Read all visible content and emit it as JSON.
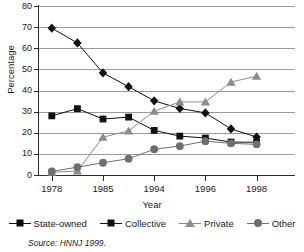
{
  "chart_data": {
    "type": "line",
    "title": "",
    "xlabel": "Year",
    "ylabel": "Percentage",
    "ylim": [
      0,
      80
    ],
    "ytick_step": 10,
    "yticks": [
      0,
      10,
      20,
      30,
      40,
      50,
      60,
      70,
      80
    ],
    "grid": true,
    "legend_position": "bottom",
    "x": [
      1,
      2,
      3,
      4,
      5,
      6,
      7,
      8,
      9,
      10
    ],
    "xtick_positions": [
      1,
      3,
      5,
      7,
      9
    ],
    "categories": [
      "1978",
      "",
      "1985",
      "",
      "1994",
      "",
      "1996",
      "",
      "1998",
      ""
    ],
    "xtick_labels": [
      "1978",
      "1985",
      "1994",
      "1996",
      "1998"
    ],
    "series": [
      {
        "name": "State-owned",
        "marker": "diamond",
        "color": "#101010",
        "values": [
          69.5,
          62.5,
          48.3,
          41.8,
          35.1,
          31.5,
          29.4,
          21.8,
          18.0,
          null
        ]
      },
      {
        "name": "Collective",
        "marker": "square",
        "color": "#101010",
        "values": [
          28.0,
          31.4,
          26.5,
          27.4,
          21.1,
          18.4,
          17.5,
          15.6,
          15.5,
          null
        ]
      },
      {
        "name": "Private",
        "marker": "triangle",
        "color": "#8c8c8c",
        "values": [
          1.3,
          1.9,
          17.9,
          20.9,
          30.2,
          34.6,
          34.6,
          44.0,
          46.8,
          null
        ]
      },
      {
        "name": "Other",
        "marker": "circle",
        "color": "#6e6e6e",
        "values": [
          1.7,
          3.7,
          5.8,
          7.7,
          12.2,
          13.7,
          16.0,
          15.0,
          14.5,
          null
        ]
      }
    ],
    "source": "Source:  HNNJ 1999."
  },
  "labels": {
    "ylabel": "Percentage",
    "xlabel": "Year",
    "source": "Source:  HNNJ 1999."
  }
}
